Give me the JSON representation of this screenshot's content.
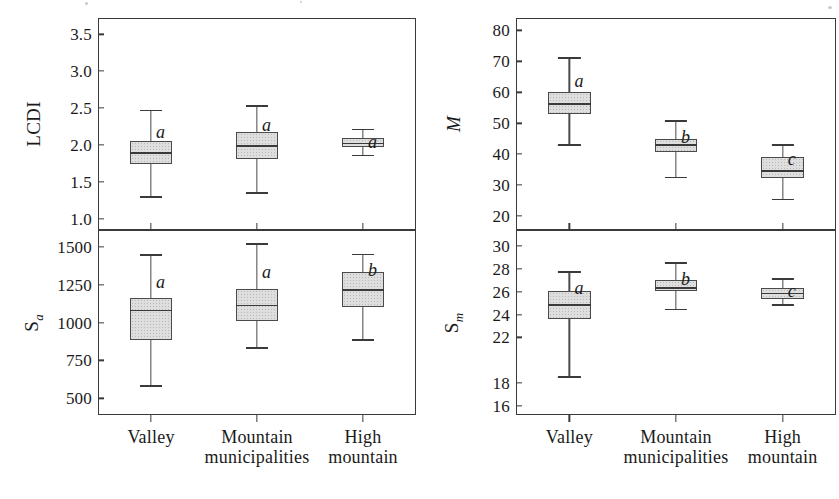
{
  "chart_data": [
    {
      "type": "box",
      "panel_id": "lcdi",
      "title": "",
      "ylabel": "LCDI",
      "xlabel": "",
      "ylim": [
        0.85,
        3.72
      ],
      "yticks": [
        3.5,
        3.0,
        2.5,
        2.0,
        1.5,
        1.0
      ],
      "ytick_labels": [
        "3.5",
        "3.0",
        "2.5",
        "2.0",
        "1.5",
        "1.0"
      ],
      "grid": false,
      "legend": "none",
      "categories": [
        "Valley",
        "Mountain municipalities",
        "High mountain"
      ],
      "boxes": [
        {
          "category": "Valley",
          "whisker_low": 1.31,
          "q1": 1.75,
          "median": 1.9,
          "q3": 2.06,
          "whisker_high": 2.48,
          "letter": "a"
        },
        {
          "category": "Mountain municipalities",
          "whisker_low": 1.36,
          "q1": 1.81,
          "median": 2.0,
          "q3": 2.18,
          "whisker_high": 2.54,
          "letter": "a"
        },
        {
          "category": "High mountain",
          "whisker_low": 1.87,
          "q1": 1.97,
          "median": 2.03,
          "q3": 2.1,
          "whisker_high": 2.22,
          "letter": "a"
        }
      ]
    },
    {
      "type": "box",
      "panel_id": "sa",
      "title": "",
      "ylabel": "Sa",
      "xlabel": "",
      "ylim": [
        390,
        1610
      ],
      "yticks": [
        1500,
        1250,
        1000,
        750,
        500
      ],
      "ytick_labels": [
        "1500",
        "1250",
        "1000",
        "750",
        "500"
      ],
      "grid": false,
      "legend": "none",
      "categories": [
        "Valley",
        "Mountain municipalities",
        "High mountain"
      ],
      "boxes": [
        {
          "category": "Valley",
          "whisker_low": 588,
          "q1": 884,
          "median": 1085,
          "q3": 1160,
          "whisker_high": 1452,
          "letter": "a"
        },
        {
          "category": "Mountain municipalities",
          "whisker_low": 836,
          "q1": 1012,
          "median": 1118,
          "q3": 1218,
          "whisker_high": 1522,
          "letter": "a"
        },
        {
          "category": "High mountain",
          "whisker_low": 890,
          "q1": 1100,
          "median": 1220,
          "q3": 1330,
          "whisker_high": 1455,
          "letter": "b"
        }
      ]
    },
    {
      "type": "box",
      "panel_id": "m",
      "title": "",
      "ylabel": "M",
      "xlabel": "",
      "ylim": [
        15.5,
        84.0
      ],
      "yticks": [
        80,
        70,
        60,
        50,
        40,
        30,
        20
      ],
      "ytick_labels": [
        "80",
        "70",
        "60",
        "50",
        "40",
        "30",
        "20"
      ],
      "grid": false,
      "legend": "none",
      "categories": [
        "Valley",
        "Mountain municipalities",
        "High mountain"
      ],
      "boxes": [
        {
          "category": "Valley",
          "whisker_low": 43.2,
          "q1": 53.0,
          "median": 56.5,
          "q3": 60.0,
          "whisker_high": 71.4,
          "letter": "a"
        },
        {
          "category": "Mountain municipalities",
          "whisker_low": 32.7,
          "q1": 40.8,
          "median": 43.2,
          "q3": 44.8,
          "whisker_high": 50.9,
          "letter": "b"
        },
        {
          "category": "High mountain",
          "whisker_low": 25.6,
          "q1": 32.2,
          "median": 34.9,
          "q3": 39.0,
          "whisker_high": 43.2,
          "letter": "c"
        }
      ]
    },
    {
      "type": "box",
      "panel_id": "sm",
      "title": "",
      "ylabel": "Sm",
      "xlabel": "",
      "ylim": [
        15.2,
        31.4
      ],
      "yticks": [
        30,
        28,
        26,
        24,
        22,
        18,
        16
      ],
      "ytick_labels": [
        "30",
        "28",
        "26",
        "24",
        "22",
        "18",
        "16"
      ],
      "grid": false,
      "legend": "none",
      "categories": [
        "Valley",
        "Mountain municipalities",
        "High mountain"
      ],
      "boxes": [
        {
          "category": "Valley",
          "whisker_low": 18.6,
          "q1": 23.6,
          "median": 24.9,
          "q3": 26.1,
          "whisker_high": 27.8,
          "letter": "a"
        },
        {
          "category": "Mountain municipalities",
          "whisker_low": 24.5,
          "q1": 26.1,
          "median": 26.4,
          "q3": 27.0,
          "whisker_high": 28.6,
          "letter": "b"
        },
        {
          "category": "High mountain",
          "whisker_low": 24.9,
          "q1": 25.4,
          "median": 25.9,
          "q3": 26.3,
          "whisker_high": 27.2,
          "letter": "c"
        }
      ]
    }
  ],
  "panels": {
    "lcdi": {
      "ylabel_text": "LCDI",
      "ticks": [
        "3.5",
        "3.0",
        "2.5",
        "2.0",
        "1.5",
        "1.0"
      ],
      "letters": [
        "a",
        "a",
        "a"
      ]
    },
    "sa": {
      "ylabel_main": "S",
      "ylabel_sub": "a",
      "ticks": [
        "1500",
        "1250",
        "1000",
        "750",
        "500"
      ],
      "letters": [
        "a",
        "a",
        "b"
      ]
    },
    "m": {
      "ylabel_text": "M",
      "ticks": [
        "80",
        "70",
        "60",
        "50",
        "40",
        "30",
        "20"
      ],
      "letters": [
        "a",
        "b",
        "c"
      ]
    },
    "sm": {
      "ylabel_main": "S",
      "ylabel_sub": "m",
      "ticks": [
        "30",
        "28",
        "26",
        "24",
        "22",
        "18",
        "16"
      ],
      "letters": [
        "a",
        "b",
        "c"
      ]
    }
  },
  "xaxis": {
    "categories": [
      {
        "line1": "Valley",
        "line2": ""
      },
      {
        "line1": "Mountain",
        "line2": "municipalities"
      },
      {
        "line1": "High",
        "line2": "mountain"
      }
    ]
  },
  "colors": {
    "box_fill": "#dedede",
    "box_edge": "#4a4a4a",
    "axis": "#3a3a3a",
    "text": "#1a1a1a",
    "background": "#ffffff"
  }
}
